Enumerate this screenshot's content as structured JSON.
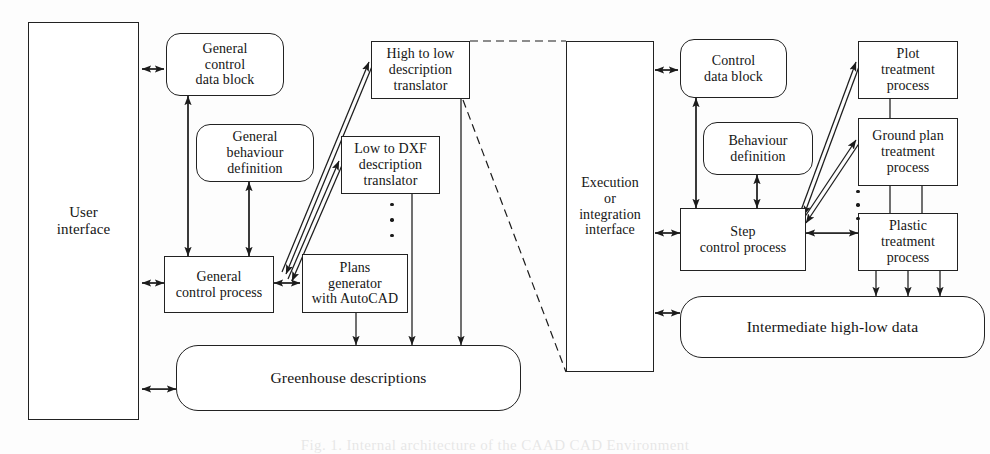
{
  "diagram": {
    "caption": "Fig. 1. Internal architecture of the CAAD CAD Environment",
    "colors": {
      "stroke": "#222222",
      "fill": "#ffffff",
      "background": "#fdfdfd",
      "dashed": "#3a3a3a"
    },
    "left_panel": {
      "interface": {
        "label": "User\ninterface"
      },
      "nodes": [
        {
          "id": "general-control-data-block",
          "label": "General\ncontrol\ndata block",
          "shape": "rounded"
        },
        {
          "id": "general-behaviour-definition",
          "label": "General\nbehaviour\ndefinition",
          "shape": "rounded"
        },
        {
          "id": "general-control-process",
          "label": "General\ncontrol process",
          "shape": "rect"
        },
        {
          "id": "plans-generator-with-autocad",
          "label": "Plans\ngenerator\nwith AutoCAD",
          "shape": "rect"
        },
        {
          "id": "high-to-low-description-translator",
          "label": "High to low\ndescription\ntranslator",
          "shape": "rect"
        },
        {
          "id": "low-to-dxf-description-translator",
          "label": "Low to DXF\ndescription\ntranslator",
          "shape": "rect"
        },
        {
          "id": "greenhouse-descriptions",
          "label": "Greenhouse descriptions",
          "shape": "rounded-lg"
        }
      ]
    },
    "right_panel": {
      "interface": {
        "label": "Execution\nor\nintegration\ninterface"
      },
      "nodes": [
        {
          "id": "control-data-block",
          "label": "Control\ndata block",
          "shape": "rounded"
        },
        {
          "id": "behaviour-definition",
          "label": "Behaviour\ndefinition",
          "shape": "rounded"
        },
        {
          "id": "step-control-process",
          "label": "Step\ncontrol process",
          "shape": "rect"
        },
        {
          "id": "plot-treatment-process",
          "label": "Plot\ntreatment\nprocess",
          "shape": "rect"
        },
        {
          "id": "ground-plan-treatment-process",
          "label": "Ground plan\ntreatment\nprocess",
          "shape": "rect"
        },
        {
          "id": "plastic-treatment-process",
          "label": "Plastic\ntreatment\nprocess",
          "shape": "rect"
        },
        {
          "id": "intermediate-high-low-data",
          "label": "Intermediate high-low data",
          "shape": "rounded-lg"
        }
      ]
    },
    "ellipsis_markers": [
      {
        "id": "translator-ellipsis",
        "note": "vertical dots between translator list items"
      },
      {
        "id": "treatment-ellipsis",
        "note": "vertical dots between treatment process list items"
      }
    ]
  }
}
